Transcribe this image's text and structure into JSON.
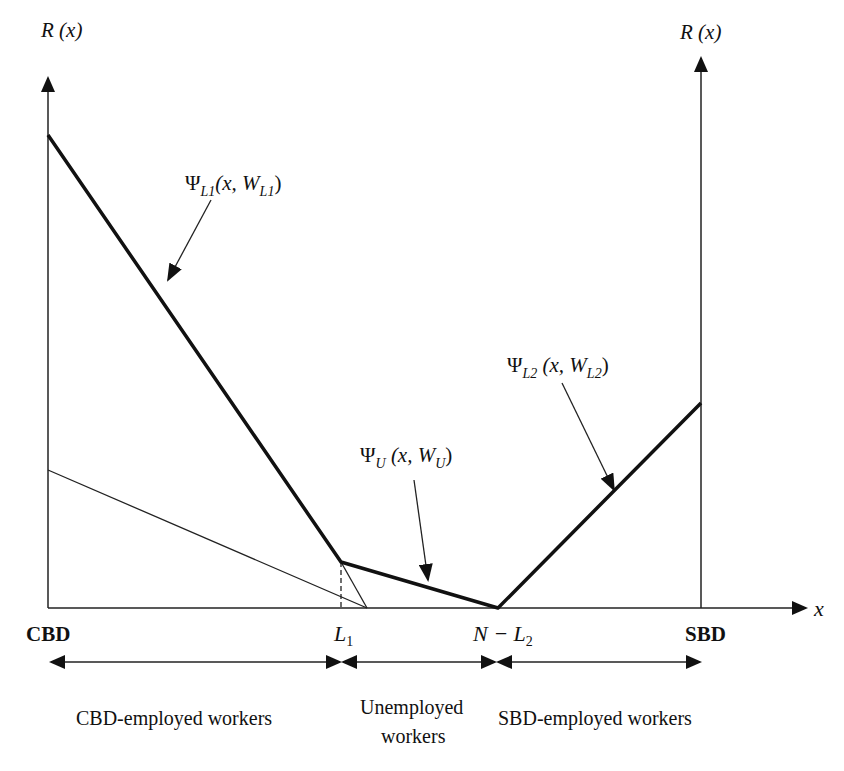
{
  "axes": {
    "left_y_label": "R (x)",
    "right_y_label": "R (x)",
    "x_label": "x"
  },
  "x_ticks": {
    "cbd": "CBD",
    "l1_main": "L",
    "l1_sub": "1",
    "nl2_main": "N − L",
    "nl2_sub": "2",
    "sbd": "SBD"
  },
  "curves": {
    "psi_l1": {
      "psi": "Ψ",
      "sub": "L1",
      "args_open": "(x, W",
      "args_sub": "L1",
      "args_close": ")"
    },
    "psi_u": {
      "psi": "Ψ",
      "sub": "U",
      "args_open": " (x, W",
      "args_sub": "U",
      "args_close": ")"
    },
    "psi_l2": {
      "psi": "Ψ",
      "sub": "L2",
      "args_open": " (x, W",
      "args_sub": "L2",
      "args_close": ")"
    }
  },
  "regions": {
    "cbd_workers": "CBD-employed workers",
    "unemployed_line1": "Unemployed",
    "unemployed_line2": "workers",
    "sbd_workers": "SBD-employed workers"
  },
  "colors": {
    "ink": "#111111",
    "background": "#ffffff"
  }
}
